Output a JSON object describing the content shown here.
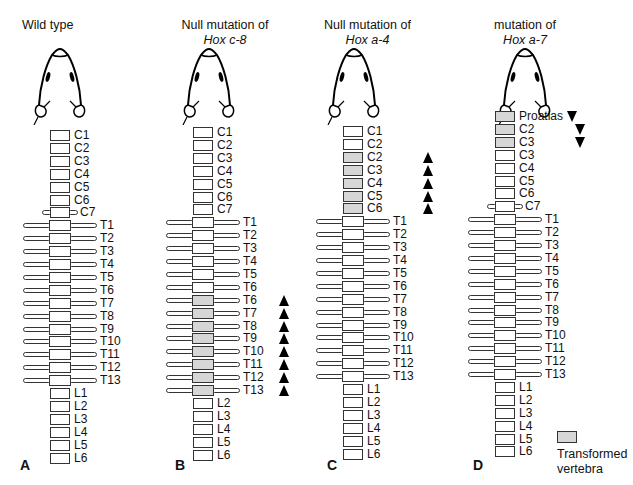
{
  "figure": {
    "legend": {
      "swatch_color": "#d6d6d6",
      "label_line1": "Transformed",
      "label_line2": "vertebra"
    },
    "colors": {
      "shaded": "#d6d6d6",
      "outline": "#333333",
      "arrow": "#000000"
    },
    "panels": [
      {
        "letter": "A",
        "title_line1": "Wild type",
        "title_gene": "",
        "vertebrae": [
          {
            "label": "C1",
            "type": "cervical",
            "shaded": false
          },
          {
            "label": "C2",
            "type": "cervical",
            "shaded": false
          },
          {
            "label": "C3",
            "type": "cervical",
            "shaded": false
          },
          {
            "label": "C4",
            "type": "cervical",
            "shaded": false
          },
          {
            "label": "C5",
            "type": "cervical",
            "shaded": false
          },
          {
            "label": "C6",
            "type": "cervical",
            "shaded": false
          },
          {
            "label": "C7",
            "type": "c7",
            "shaded": false
          },
          {
            "label": "T1",
            "type": "thoracic",
            "shaded": false
          },
          {
            "label": "T2",
            "type": "thoracic",
            "shaded": false
          },
          {
            "label": "T3",
            "type": "thoracic",
            "shaded": false
          },
          {
            "label": "T4",
            "type": "thoracic",
            "shaded": false
          },
          {
            "label": "T5",
            "type": "thoracic",
            "shaded": false
          },
          {
            "label": "T6",
            "type": "thoracic",
            "shaded": false
          },
          {
            "label": "T7",
            "type": "thoracic",
            "shaded": false
          },
          {
            "label": "T8",
            "type": "thoracic",
            "shaded": false
          },
          {
            "label": "T9",
            "type": "thoracic",
            "shaded": false
          },
          {
            "label": "T10",
            "type": "thoracic",
            "shaded": false
          },
          {
            "label": "T11",
            "type": "thoracic",
            "shaded": false
          },
          {
            "label": "T12",
            "type": "thoracic",
            "shaded": false
          },
          {
            "label": "T13",
            "type": "thoracic",
            "shaded": false
          },
          {
            "label": "L1",
            "type": "lumbar",
            "shaded": false
          },
          {
            "label": "L2",
            "type": "lumbar",
            "shaded": false
          },
          {
            "label": "L3",
            "type": "lumbar",
            "shaded": false
          },
          {
            "label": "L4",
            "type": "lumbar",
            "shaded": false
          },
          {
            "label": "L5",
            "type": "lumbar",
            "shaded": false
          },
          {
            "label": "L6",
            "type": "lumbar",
            "shaded": false
          }
        ]
      },
      {
        "letter": "B",
        "title_line1": "Null mutation of",
        "title_gene": "Hox c-8",
        "vertebrae": [
          {
            "label": "C1",
            "type": "cervical",
            "shaded": false
          },
          {
            "label": "C2",
            "type": "cervical",
            "shaded": false
          },
          {
            "label": "C3",
            "type": "cervical",
            "shaded": false
          },
          {
            "label": "C4",
            "type": "cervical",
            "shaded": false
          },
          {
            "label": "C5",
            "type": "cervical",
            "shaded": false
          },
          {
            "label": "C6",
            "type": "cervical",
            "shaded": false
          },
          {
            "label": "C7",
            "type": "cervical",
            "shaded": false
          },
          {
            "label": "T1",
            "type": "thoracic",
            "shaded": false
          },
          {
            "label": "T2",
            "type": "thoracic",
            "shaded": false
          },
          {
            "label": "T3",
            "type": "thoracic",
            "shaded": false
          },
          {
            "label": "T4",
            "type": "thoracic",
            "shaded": false
          },
          {
            "label": "T5",
            "type": "thoracic",
            "shaded": false
          },
          {
            "label": "T6",
            "type": "thoracic",
            "shaded": false
          },
          {
            "label": "T6",
            "type": "thoracic",
            "shaded": true,
            "arrow": "up"
          },
          {
            "label": "T7",
            "type": "thoracic",
            "shaded": true,
            "arrow": "up"
          },
          {
            "label": "T8",
            "type": "thoracic",
            "shaded": true,
            "arrow": "up"
          },
          {
            "label": "T9",
            "type": "thoracic",
            "shaded": true,
            "arrow": "up"
          },
          {
            "label": "T10",
            "type": "thoracic",
            "shaded": true,
            "arrow": "up"
          },
          {
            "label": "T11",
            "type": "thoracic",
            "shaded": true,
            "arrow": "up"
          },
          {
            "label": "T12",
            "type": "thoracic",
            "shaded": true,
            "arrow": "up"
          },
          {
            "label": "T13",
            "type": "thoracic",
            "shaded": true,
            "arrow": "up"
          },
          {
            "label": "L2",
            "type": "lumbar",
            "shaded": false
          },
          {
            "label": "L3",
            "type": "lumbar",
            "shaded": false
          },
          {
            "label": "L4",
            "type": "lumbar",
            "shaded": false
          },
          {
            "label": "L5",
            "type": "lumbar",
            "shaded": false
          },
          {
            "label": "L6",
            "type": "lumbar",
            "shaded": false
          }
        ]
      },
      {
        "letter": "C",
        "title_line1": "Null mutation of",
        "title_gene": "Hox a-4",
        "vertebrae": [
          {
            "label": "C1",
            "type": "cervical",
            "shaded": false
          },
          {
            "label": "C2",
            "type": "cervical",
            "shaded": false
          },
          {
            "label": "C2",
            "type": "cervical",
            "shaded": true,
            "arrow": "up"
          },
          {
            "label": "C3",
            "type": "cervical",
            "shaded": true,
            "arrow": "up"
          },
          {
            "label": "C4",
            "type": "cervical",
            "shaded": true,
            "arrow": "up"
          },
          {
            "label": "C5",
            "type": "cervical",
            "shaded": true,
            "arrow": "up"
          },
          {
            "label": "C6",
            "type": "cervical",
            "shaded": true,
            "arrow": "up"
          },
          {
            "label": "T1",
            "type": "thoracic",
            "shaded": false
          },
          {
            "label": "T2",
            "type": "thoracic",
            "shaded": false
          },
          {
            "label": "T3",
            "type": "thoracic",
            "shaded": false
          },
          {
            "label": "T4",
            "type": "thoracic",
            "shaded": false
          },
          {
            "label": "T5",
            "type": "thoracic",
            "shaded": false
          },
          {
            "label": "T6",
            "type": "thoracic",
            "shaded": false
          },
          {
            "label": "T7",
            "type": "thoracic",
            "shaded": false
          },
          {
            "label": "T8",
            "type": "thoracic",
            "shaded": false
          },
          {
            "label": "T9",
            "type": "thoracic",
            "shaded": false
          },
          {
            "label": "T10",
            "type": "thoracic",
            "shaded": false
          },
          {
            "label": "T11",
            "type": "thoracic",
            "shaded": false
          },
          {
            "label": "T12",
            "type": "thoracic",
            "shaded": false
          },
          {
            "label": "T13",
            "type": "thoracic",
            "shaded": false
          },
          {
            "label": "L1",
            "type": "lumbar",
            "shaded": false
          },
          {
            "label": "L2",
            "type": "lumbar",
            "shaded": false
          },
          {
            "label": "L3",
            "type": "lumbar",
            "shaded": false
          },
          {
            "label": "L4",
            "type": "lumbar",
            "shaded": false
          },
          {
            "label": "L5",
            "type": "lumbar",
            "shaded": false
          },
          {
            "label": "L6",
            "type": "lumbar",
            "shaded": false
          }
        ]
      },
      {
        "letter": "D",
        "title_line1": "mutation of",
        "title_gene": "Hox a-7",
        "vertebrae": [
          {
            "label": "Proatlas",
            "type": "cervical",
            "shaded": true,
            "arrow": "down"
          },
          {
            "label": "C2",
            "type": "cervical",
            "shaded": true,
            "arrow": "down"
          },
          {
            "label": "C3",
            "type": "cervical",
            "shaded": true,
            "arrow": "down"
          },
          {
            "label": "C3",
            "type": "cervical",
            "shaded": false
          },
          {
            "label": "C4",
            "type": "cervical",
            "shaded": false
          },
          {
            "label": "C5",
            "type": "cervical",
            "shaded": false
          },
          {
            "label": "C6",
            "type": "cervical",
            "shaded": false
          },
          {
            "label": "C7",
            "type": "c7",
            "shaded": false
          },
          {
            "label": "T1",
            "type": "thoracic",
            "shaded": false
          },
          {
            "label": "T2",
            "type": "thoracic",
            "shaded": false
          },
          {
            "label": "T3",
            "type": "thoracic",
            "shaded": false
          },
          {
            "label": "T4",
            "type": "thoracic",
            "shaded": false
          },
          {
            "label": "T5",
            "type": "thoracic",
            "shaded": false
          },
          {
            "label": "T6",
            "type": "thoracic",
            "shaded": false
          },
          {
            "label": "T7",
            "type": "thoracic",
            "shaded": false
          },
          {
            "label": "T8",
            "type": "thoracic",
            "shaded": false
          },
          {
            "label": "T9",
            "type": "thoracic",
            "shaded": false
          },
          {
            "label": "T10",
            "type": "thoracic",
            "shaded": false
          },
          {
            "label": "T11",
            "type": "thoracic",
            "shaded": false
          },
          {
            "label": "T12",
            "type": "thoracic",
            "shaded": false
          },
          {
            "label": "T13",
            "type": "thoracic",
            "shaded": false
          },
          {
            "label": "L1",
            "type": "lumbar",
            "shaded": false
          },
          {
            "label": "L2",
            "type": "lumbar",
            "shaded": false
          },
          {
            "label": "L3",
            "type": "lumbar",
            "shaded": false
          },
          {
            "label": "L4",
            "type": "lumbar",
            "shaded": false
          },
          {
            "label": "L5",
            "type": "lumbar",
            "shaded": false
          },
          {
            "label": "L6",
            "type": "lumbar",
            "shaded": false
          }
        ]
      }
    ]
  }
}
